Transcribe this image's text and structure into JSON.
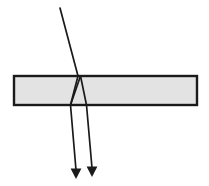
{
  "figure": {
    "canvas": {
      "width": 209,
      "height": 186,
      "background": "#ffffff"
    },
    "colors": {
      "slab_fill": "#e3e3e3",
      "slab_border": "#1a1a1a",
      "ray_stroke": "#1a1a1a",
      "arrow_fill": "#1a1a1a",
      "background": "#ffffff"
    },
    "slab": {
      "label": "glass-slab",
      "x": 14,
      "y": 76,
      "width": 183,
      "height": 29,
      "border_width": 2.4,
      "fill": "#e3e3e3",
      "stroke": "#1a1a1a"
    },
    "rays": {
      "stroke_width": 1.7,
      "incident": {
        "label": "incident-ray",
        "points": "60,8 78,76"
      },
      "refracted_down": {
        "label": "refracted-ray-inside-slab",
        "points": "78,76 70.5,105"
      },
      "internal_reflection_up": {
        "label": "internally-reflected-ray",
        "points": "70.5,105 80.5,76"
      },
      "internal_second_down": {
        "label": "second-internal-ray",
        "points": "80.5,76 86.5,105"
      },
      "exit_left": {
        "label": "exit-ray-left",
        "points": "70.5,105 76,170"
      },
      "exit_right": {
        "label": "exit-ray-right",
        "points": "86.5,105 92,168"
      }
    },
    "arrowheads": [
      {
        "label": "arrowhead-left",
        "tip_x": 76,
        "tip_y": 179,
        "half_width": 5.4,
        "length": 10.5,
        "fill": "#1a1a1a"
      },
      {
        "label": "arrowhead-right",
        "tip_x": 92,
        "tip_y": 177,
        "half_width": 5.4,
        "length": 10.5,
        "fill": "#1a1a1a"
      }
    ]
  }
}
